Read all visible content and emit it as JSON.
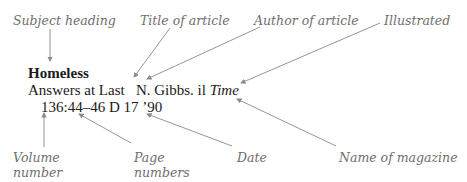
{
  "entry": {
    "subject_heading": "Homeless",
    "line2": {
      "title": "Answers at Last",
      "author": "N. Gibbs.",
      "illustrated": "il",
      "magazine": "Time"
    },
    "line3": {
      "volume": "136",
      "pages": ":44–46",
      "date": " D 17 ’90"
    }
  },
  "labels": {
    "subject_heading": "Subject heading",
    "title_of_article": "Title of article",
    "author_of_article": "Author of article",
    "illustrated": "Illustrated",
    "volume_number_1": "Volume",
    "volume_number_2": "number",
    "page_numbers_1": "Page",
    "page_numbers_2": "numbers",
    "date": "Date",
    "name_of_magazine": "Name of magazine"
  },
  "colors": {
    "label_text": "#6e6e6e",
    "entry_text": "#1a1a1a",
    "arrow": "#8a8a8a"
  }
}
